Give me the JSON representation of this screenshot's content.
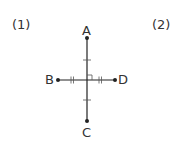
{
  "problems": [
    {
      "number": "(1)"
    },
    {
      "number": "(2)"
    }
  ],
  "figure": {
    "points": {
      "A": "A",
      "B": "B",
      "C": "C",
      "D": "D"
    },
    "line_color": "#222222"
  }
}
